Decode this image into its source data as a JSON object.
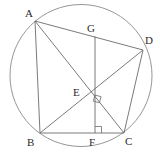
{
  "figure": {
    "canvas": {
      "width": 160,
      "height": 155
    },
    "stroke_color": "#6b6b6b",
    "label_color": "#2b2b2b",
    "background_color": "#ffffff",
    "circle": {
      "name": "circumcircle",
      "cx": 81,
      "cy": 75.5,
      "r": 71
    },
    "points": [
      {
        "id": "A",
        "label": "A",
        "x": 35,
        "y": 21,
        "label_x": 25,
        "label_y": 8
      },
      {
        "id": "G",
        "label": "G",
        "x": 95,
        "y": 36.5,
        "label_x": 87,
        "label_y": 23
      },
      {
        "id": "D",
        "label": "D",
        "x": 143,
        "y": 50,
        "label_x": 145,
        "label_y": 35
      },
      {
        "id": "E",
        "label": "E",
        "x": 95,
        "y": 95,
        "label_x": 73,
        "label_y": 87
      },
      {
        "id": "B",
        "label": "B",
        "x": 40,
        "y": 133,
        "label_x": 27,
        "label_y": 137
      },
      {
        "id": "F",
        "label": "F",
        "x": 95,
        "y": 133,
        "label_x": 89,
        "label_y": 137
      },
      {
        "id": "C",
        "label": "C",
        "x": 124,
        "y": 133,
        "label_x": 125,
        "label_y": 136
      }
    ],
    "segments": [
      {
        "name": "segment-AB",
        "from": "A",
        "to": "B"
      },
      {
        "name": "segment-AD",
        "from": "A",
        "to": "D"
      },
      {
        "name": "segment-AC",
        "from": "A",
        "to": "C"
      },
      {
        "name": "segment-BD",
        "from": "B",
        "to": "D"
      },
      {
        "name": "segment-BC",
        "from": "B",
        "to": "C"
      },
      {
        "name": "segment-DC",
        "from": "D",
        "to": "C"
      },
      {
        "name": "segment-GF",
        "from": "G",
        "to": "F"
      }
    ],
    "right_angles": [
      {
        "name": "right-angle-at-E",
        "vertex": "E",
        "note": "diagonals AC and BD are perpendicular"
      },
      {
        "name": "right-angle-at-F",
        "vertex": "F",
        "note": "GF is perpendicular to BC"
      }
    ]
  }
}
